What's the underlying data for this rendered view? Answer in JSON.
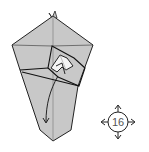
{
  "diagram": {
    "type": "origami-fold-step",
    "step_number": "16",
    "step_symbol": "turn-over / rotate indicator with four arrows",
    "colors": {
      "paper": "#c8c8c8",
      "paper_light": "#f4f4f4",
      "line": "#222222",
      "background": "#ffffff"
    },
    "annotations": [
      "fold arrow pointing down from center point to bottom"
    ]
  }
}
